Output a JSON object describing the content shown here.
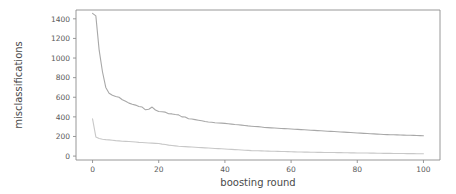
{
  "chart_data": {
    "type": "line",
    "title": "",
    "xlabel": "boosting round",
    "ylabel": "misclassifications",
    "xlim": [
      -5,
      105
    ],
    "ylim": [
      -40,
      1490
    ],
    "grid": false,
    "legend": null,
    "xticks": [
      0,
      20,
      40,
      60,
      80,
      100
    ],
    "xtick_labels": [
      "0",
      "20",
      "40",
      "60",
      "80",
      "100"
    ],
    "yticks": [
      0,
      200,
      400,
      600,
      800,
      1000,
      1200,
      1400
    ],
    "ytick_labels": [
      "0",
      "200",
      "400",
      "600",
      "800",
      "1000",
      "1200",
      "1400"
    ],
    "x": [
      0,
      1,
      2,
      3,
      4,
      5,
      6,
      7,
      8,
      9,
      10,
      11,
      12,
      13,
      14,
      15,
      16,
      17,
      18,
      19,
      20,
      21,
      22,
      23,
      24,
      25,
      26,
      27,
      28,
      29,
      30,
      31,
      32,
      33,
      34,
      35,
      36,
      37,
      38,
      39,
      40,
      41,
      42,
      43,
      44,
      45,
      46,
      47,
      48,
      49,
      50,
      51,
      52,
      53,
      54,
      55,
      56,
      57,
      58,
      59,
      60,
      61,
      62,
      63,
      64,
      65,
      66,
      67,
      68,
      69,
      70,
      71,
      72,
      73,
      74,
      75,
      76,
      77,
      78,
      79,
      80,
      81,
      82,
      83,
      84,
      85,
      86,
      87,
      88,
      89,
      90,
      91,
      92,
      93,
      94,
      95,
      96,
      97,
      98,
      99,
      100
    ],
    "series": [
      {
        "name": "test misclassifications",
        "color": "#a8a8a8",
        "values": [
          1455,
          1430,
          1080,
          860,
          700,
          640,
          620,
          608,
          600,
          575,
          560,
          540,
          528,
          520,
          505,
          500,
          472,
          478,
          500,
          470,
          455,
          452,
          448,
          432,
          430,
          424,
          420,
          400,
          398,
          380,
          378,
          372,
          366,
          360,
          352,
          348,
          345,
          340,
          338,
          336,
          334,
          330,
          326,
          322,
          320,
          316,
          312,
          308,
          305,
          302,
          300,
          296,
          292,
          290,
          288,
          286,
          284,
          282,
          280,
          278,
          276,
          274,
          272,
          270,
          268,
          266,
          264,
          262,
          260,
          258,
          256,
          254,
          252,
          250,
          248,
          246,
          244,
          242,
          240,
          238,
          236,
          234,
          232,
          230,
          228,
          226,
          224,
          222,
          220,
          219,
          218,
          217,
          216,
          215,
          214,
          213,
          212,
          211,
          210,
          209,
          208
        ]
      },
      {
        "name": "train misclassifications",
        "color": "#c8c8c8",
        "values": [
          380,
          195,
          180,
          172,
          168,
          165,
          162,
          158,
          155,
          152,
          150,
          148,
          146,
          143,
          140,
          138,
          136,
          134,
          132,
          130,
          128,
          122,
          118,
          112,
          108,
          104,
          100,
          98,
          96,
          94,
          92,
          90,
          88,
          86,
          84,
          82,
          80,
          78,
          76,
          74,
          72,
          70,
          68,
          66,
          64,
          62,
          60,
          58,
          56,
          55,
          54,
          53,
          52,
          51,
          50,
          49,
          48,
          47,
          46,
          45,
          44,
          43,
          42,
          41,
          40,
          40,
          39,
          39,
          38,
          38,
          37,
          37,
          36,
          36,
          35,
          35,
          34,
          34,
          33,
          33,
          32,
          32,
          31,
          31,
          30,
          30,
          29,
          29,
          28,
          28,
          28,
          27,
          27,
          26,
          26,
          25,
          25,
          25,
          24,
          24,
          24
        ]
      }
    ]
  }
}
